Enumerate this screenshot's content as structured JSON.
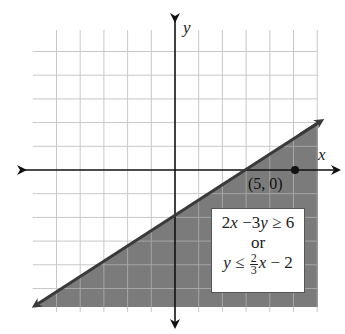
{
  "chart_data": {
    "type": "line",
    "title": "",
    "xlabel": "x",
    "ylabel": "y",
    "xlim": [
      -6,
      6
    ],
    "ylim": [
      -6,
      6
    ],
    "grid": true,
    "grid_step": 1,
    "boundary_line": {
      "equation": "y = (2/3)x - 2",
      "slope": 0.6667,
      "intercept": -2,
      "style": "solid",
      "points": [
        [
          -6,
          -6
        ],
        [
          0,
          -2
        ],
        [
          3,
          0
        ],
        [
          6,
          2
        ]
      ]
    },
    "shaded_region": "below line (y <= (2/3)x - 2)",
    "points": [
      {
        "x": 5,
        "y": 0,
        "label": "(5, 0)"
      }
    ],
    "annotation": {
      "line1": "2x −3y ≥ 6",
      "line2": "or",
      "line3": "y ≤ (2/3)x − 2"
    }
  },
  "labels": {
    "x_axis": "x",
    "y_axis": "y",
    "point": "(5, 0)"
  },
  "legend_box": {
    "ineq1_a": "2",
    "ineq1_var_x": "x",
    "ineq1_b": " −3",
    "ineq1_var_y": "y",
    "ineq1_c": " ≥ 6",
    "or": "or",
    "ineq2_var_y": "y",
    "ineq2_op": " ≤ ",
    "frac_num": "2",
    "frac_den": "3",
    "ineq2_var_x": "x",
    "ineq2_tail": " − 2"
  },
  "colors": {
    "shade": "#7b7b7b",
    "grid": "#c8c8c8",
    "grid_in_shade": "#a6a6a6",
    "axis": "#111111",
    "boundary": "#3a3a3a"
  }
}
